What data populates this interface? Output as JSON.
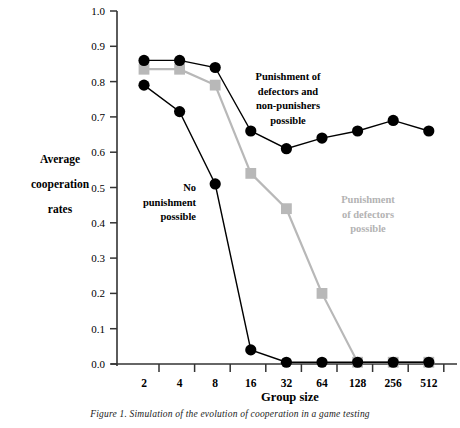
{
  "figure": {
    "caption": "Figure 1. Simulation of the evolution of cooperation in a game testing",
    "y_axis_label_lines": [
      "Average",
      "cooperation",
      "rates"
    ],
    "x_axis_title": "Group size"
  },
  "annotations": {
    "series_punish_both_lines": [
      "Punishment of",
      "defectors and",
      "non-punishers",
      "possible"
    ],
    "series_no_punishment_lines": [
      "No",
      "punishment",
      "possible"
    ],
    "series_punish_defectors_lines": [
      "Punishment",
      "of defectors",
      "possible"
    ]
  },
  "colors": {
    "dark": "#000000",
    "gray": "#b8b8b8",
    "axis": "#333333",
    "background": "#ffffff"
  },
  "chart_data": {
    "type": "line",
    "title": "",
    "subtitle": "",
    "xlabel": "Group size",
    "ylabel": "Average cooperation rates",
    "categories": [
      "2",
      "4",
      "8",
      "16",
      "32",
      "64",
      "128",
      "256",
      "512"
    ],
    "x_tick_labels": [
      "2",
      "4",
      "8",
      "16",
      "32",
      "64",
      "128",
      "256",
      "512"
    ],
    "y_tick_labels": [
      "0.0",
      "0.1",
      "0.2",
      "0.3",
      "0.4",
      "0.5",
      "0.6",
      "0.7",
      "0.8",
      "0.9",
      "1.0"
    ],
    "ylim": [
      0.0,
      1.0
    ],
    "y_major_step": 0.1,
    "grid": false,
    "legend_position": "inline-annotations",
    "series": [
      {
        "name": "Punishment of defectors and non-punishers possible",
        "marker": "circle",
        "color": "#000000",
        "values": [
          0.86,
          0.86,
          0.84,
          0.66,
          0.61,
          0.64,
          0.66,
          0.69,
          0.66
        ]
      },
      {
        "name": "Punishment of defectors possible",
        "marker": "square",
        "color": "#b8b8b8",
        "values": [
          0.835,
          0.835,
          0.79,
          0.54,
          0.44,
          0.2,
          0.005,
          0.005,
          0.005
        ]
      },
      {
        "name": "No punishment possible",
        "marker": "circle",
        "color": "#000000",
        "values": [
          0.79,
          0.715,
          0.51,
          0.04,
          0.005,
          0.005,
          0.005,
          0.005,
          0.005
        ]
      }
    ]
  }
}
